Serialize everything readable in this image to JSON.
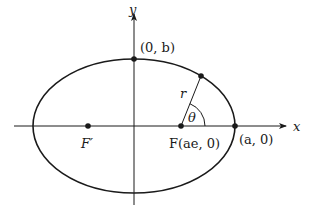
{
  "diagram": {
    "type": "ellipse-polar-coordinates",
    "colors": {
      "stroke": "#1a1a1a",
      "background": "#ffffff"
    },
    "axes": {
      "x_label": "x",
      "y_label": "y"
    },
    "ellipse": {
      "center": [
        134,
        126
      ],
      "rx": 101,
      "ry": 67
    },
    "points": {
      "top_vertex": {
        "label": "(0, b)",
        "pos": [
          134,
          59
        ]
      },
      "right_vertex": {
        "label": "(a, 0)",
        "pos": [
          235,
          126
        ]
      },
      "focus": {
        "label": "F(ae, 0)",
        "pos": [
          181,
          126
        ]
      },
      "other_focus": {
        "label": "F′",
        "pos": [
          88,
          126
        ]
      },
      "orbit_point": {
        "pos": [
          201,
          76
        ]
      }
    },
    "radius_label": "r",
    "angle_label": "θ"
  }
}
